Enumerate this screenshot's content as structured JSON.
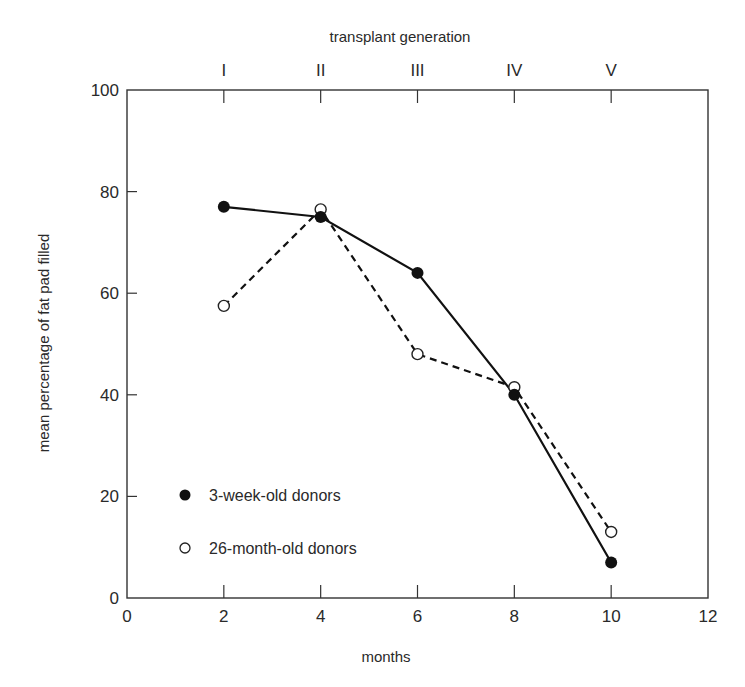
{
  "chart_data": {
    "type": "line",
    "title": "",
    "xlabel": "months",
    "ylabel": "mean percentage of fat pad filled",
    "top_axis_label": "transplant generation",
    "xlim": [
      0,
      12
    ],
    "ylim": [
      0,
      100
    ],
    "x_ticks": [
      0,
      2,
      4,
      6,
      8,
      10,
      12
    ],
    "x_tick_labels": [
      "0",
      "2",
      "4",
      "6",
      "8",
      "10",
      "12"
    ],
    "y_ticks": [
      0,
      20,
      40,
      60,
      80,
      100
    ],
    "y_tick_labels": [
      "0",
      "20",
      "40",
      "60",
      "80",
      "100"
    ],
    "top_ticks": [
      2,
      4,
      6,
      8,
      10
    ],
    "top_tick_labels": [
      "I",
      "II",
      "III",
      "IV",
      "V"
    ],
    "grid": false,
    "legend_position": "lower-left inside plot",
    "x": [
      2,
      4,
      6,
      8,
      10
    ],
    "series": [
      {
        "name": "3-week-old donors",
        "marker": "filled-circle",
        "line_style": "solid",
        "color": "#111111",
        "values": [
          77,
          75,
          64,
          40,
          7
        ]
      },
      {
        "name": "26-month-old donors",
        "marker": "open-circle",
        "line_style": "dashed",
        "color": "#111111",
        "values": [
          57.5,
          76.5,
          48,
          41.5,
          13
        ]
      }
    ]
  },
  "labels": {
    "xlabel": "months",
    "ylabel": "mean percentage of fat pad filled",
    "top_axis_label": "transplant generation",
    "legend": [
      "3-week-old donors",
      "26-month-old donors"
    ]
  }
}
